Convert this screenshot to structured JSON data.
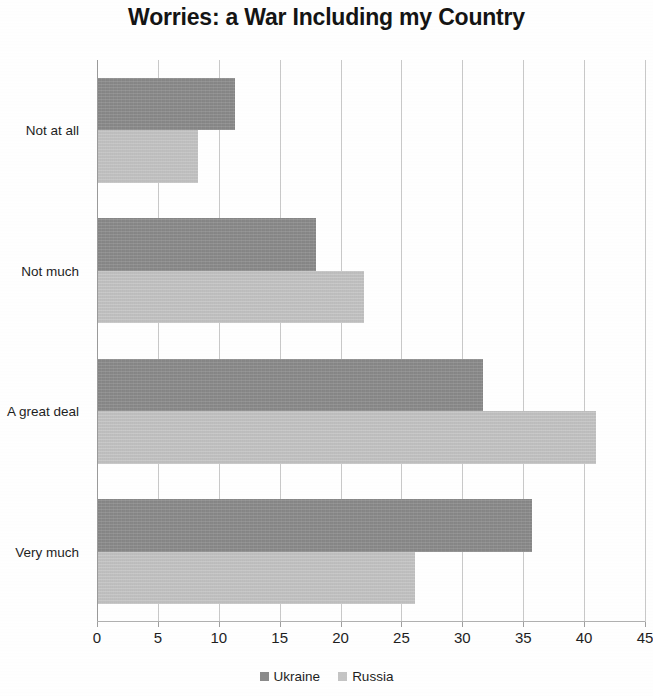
{
  "chart_data": {
    "type": "bar",
    "orientation": "horizontal",
    "title": "Worries: a War Including my Country",
    "xlabel": "",
    "ylabel": "",
    "categories": [
      "Not at all",
      "Not much",
      "A great deal",
      "Very much"
    ],
    "series": [
      {
        "name": "Ukraine",
        "color": "#8b8b8b",
        "values": [
          11.3,
          18.0,
          31.7,
          35.7
        ]
      },
      {
        "name": "Russia",
        "color": "#c5c5c5",
        "values": [
          8.3,
          21.9,
          41.0,
          26.1
        ]
      }
    ],
    "xlim": [
      0,
      45
    ],
    "xticks": [
      0,
      5,
      10,
      15,
      20,
      25,
      30,
      35,
      40,
      45
    ],
    "xtick_labels": [
      "0",
      "5",
      "10",
      "15",
      "20",
      "25",
      "30",
      "35",
      "40",
      "45"
    ],
    "grid": true,
    "grid_axis": "x",
    "legend_position": "bottom",
    "legend_entries": [
      "Ukraine",
      "Russia"
    ]
  },
  "title": {
    "text": "Worries: a War Including my Country"
  },
  "legend": {
    "items": [
      {
        "label": "Ukraine",
        "swatch": "ukraine"
      },
      {
        "label": "Russia",
        "swatch": "russia"
      }
    ]
  }
}
